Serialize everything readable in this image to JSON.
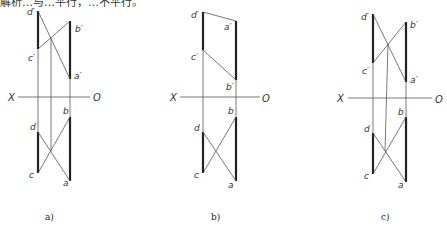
{
  "top_text_fragment": "解析…与…平行，…不平行。",
  "figures": [
    {
      "caption": "a)",
      "axis": {
        "x_label": "X",
        "o_label": "O"
      },
      "points": {
        "d_prime": "d′",
        "c_prime": "c′",
        "b_prime": "b′",
        "a_prime": "a′",
        "d": "d",
        "c": "c",
        "b": "b",
        "a": "a"
      }
    },
    {
      "caption": "b)",
      "axis": {
        "x_label": "X",
        "o_label": "O"
      },
      "points": {
        "d_prime": "d′",
        "c_prime": "c′",
        "b_prime": "b′",
        "a_prime": "a′",
        "d": "d",
        "c": "c",
        "b": "b",
        "a": "a"
      }
    },
    {
      "caption": "c)",
      "axis": {
        "x_label": "X",
        "o_label": "O"
      },
      "points": {
        "d_prime": "d′",
        "c_prime": "c′",
        "b_prime": "b′",
        "a_prime": "a′",
        "d": "d",
        "c": "c",
        "b": "b",
        "a": "a"
      }
    }
  ]
}
